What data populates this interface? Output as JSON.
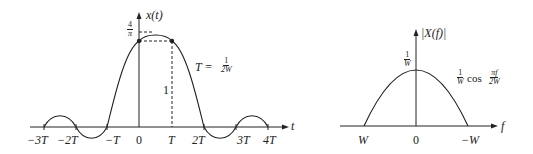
{
  "left_plot": {
    "y_label": "x(t)",
    "x_label": "t",
    "peak_label": {
      "num": "4",
      "den": "π"
    },
    "level_label": "1",
    "period_eq": {
      "lhs": "T =",
      "num": "1",
      "den": "2W"
    },
    "ticks": [
      "−3T",
      "−2T",
      "−T",
      "0",
      "T",
      "2T",
      "3T",
      "4T"
    ]
  },
  "right_plot": {
    "y_label": "|X(f)|",
    "x_label": "f",
    "peak_label": {
      "num": "1",
      "den": "W"
    },
    "curve_label": {
      "coef_num": "1",
      "coef_den": "W",
      "func": "cos",
      "arg_num": "πf",
      "arg_den": "2W"
    },
    "ticks": [
      "W",
      "0",
      "−W"
    ]
  }
}
